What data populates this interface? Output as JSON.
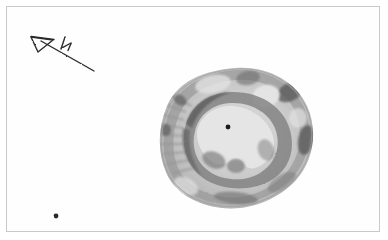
{
  "figure": {
    "kind": "pencil-field-sketch",
    "medium": "graphite pencil on white paper",
    "background_color": "#ffffff",
    "frame": {
      "present": true,
      "color": "#c9c9c9",
      "inset_px": 6,
      "width_px": 374,
      "height_px": 226
    }
  },
  "north_arrow": {
    "label": "N",
    "icon": "north-arrow-icon",
    "arrowhead_shape": "open-triangle-outline",
    "arrowhead_x": 40,
    "arrowhead_y": 44,
    "tail_x": 94,
    "tail_y": 71,
    "label_x": 66,
    "label_y": 44,
    "stroke_color": "#2b2b2b"
  },
  "ring_feature": {
    "name": "circular-ring-structure",
    "center_x": 236,
    "center_y": 138,
    "outer_radius_x": 76,
    "outer_radius_y": 70,
    "inner_court_center_x": 229,
    "inner_court_center_y": 130,
    "shading_color": "#8d8d8d",
    "dark_patch_color": "#4a4a4a",
    "light_fill_color": "#ffffff"
  },
  "center_point_marker": {
    "name": "center-point-dot",
    "x": 228,
    "y": 127,
    "radius": 2.4,
    "color": "#1a1a1a"
  },
  "auxiliary_point_marker": {
    "name": "auxiliary-point-dot",
    "x": 56,
    "y": 216,
    "radius": 2.4,
    "color": "#2a2a2a"
  },
  "annotations": {
    "visible_text": [
      "N"
    ]
  }
}
